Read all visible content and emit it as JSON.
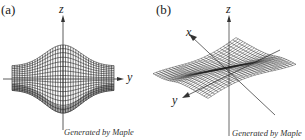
{
  "panels": [
    {
      "label": "(a)",
      "axes": {
        "vertical": "z",
        "horizontal": "y"
      },
      "credit": "Generated by Maple"
    },
    {
      "label": "(b)",
      "axes": {
        "vertical": "z",
        "x": "x",
        "y": "y"
      },
      "credit": "Generated by Maple"
    }
  ],
  "colors": {
    "line": "#222222",
    "background": "#ffffff"
  }
}
